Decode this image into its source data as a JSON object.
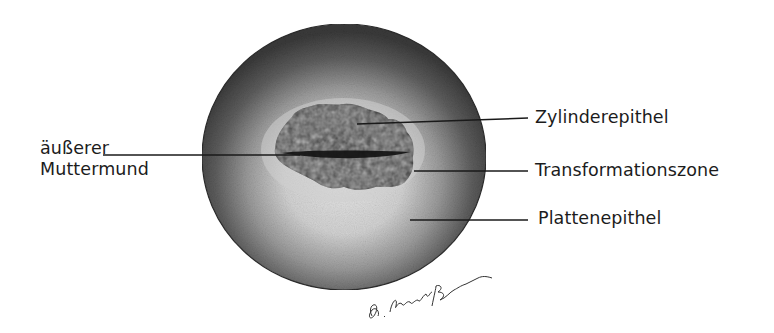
{
  "diagram": {
    "labels": {
      "outer_os_line1": "äußerer",
      "outer_os_line2": "Muttermund",
      "columnar": "Zylinderepithel",
      "transformation": "Transformationszone",
      "squamous": "Plattenepithel"
    },
    "signature": "G. Shapiro Brenna",
    "colors": {
      "background": "#ffffff",
      "text": "#1c1c1c",
      "leader_line": "#1a1a1a",
      "rim_dark": "#3a3a3a",
      "portio_light": "#d9d9d9",
      "os_tissue": "#4a4a4a",
      "os_slit": "#111111"
    }
  }
}
